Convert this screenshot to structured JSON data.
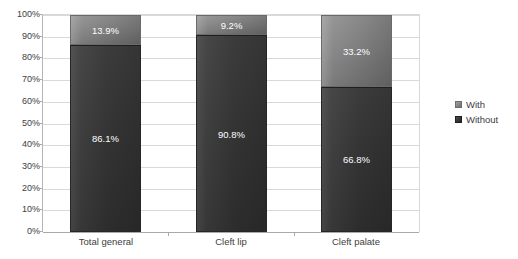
{
  "chart_data": {
    "type": "bar",
    "subtype": "100-percent-stacked-column",
    "title": "",
    "xlabel": "",
    "ylabel": "",
    "ylim": [
      0,
      100
    ],
    "grid": true,
    "legend_position": "right",
    "categories": [
      "Total general",
      "Cleft lip",
      "Cleft palate"
    ],
    "ytick_labels": [
      "100%",
      "90%",
      "80%",
      "70%",
      "60%",
      "50%",
      "40%",
      "30%",
      "20%",
      "10%",
      "0%"
    ],
    "ytick_values": [
      100,
      90,
      80,
      70,
      60,
      50,
      40,
      30,
      20,
      10,
      0
    ],
    "series": [
      {
        "name": "Without",
        "color": "#333333",
        "values": [
          86.1,
          90.8,
          66.8
        ],
        "labels": [
          "86.1%",
          "90.8%",
          "66.8%"
        ]
      },
      {
        "name": "With",
        "color": "#808080",
        "values": [
          13.9,
          9.2,
          33.2
        ],
        "labels": [
          "13.9%",
          "9.2%",
          "33.2%"
        ]
      }
    ],
    "stack_order_bottom_to_top": [
      "Without",
      "With"
    ]
  },
  "legend": {
    "items": [
      {
        "label": "With",
        "swatch": "with-swatch-icon"
      },
      {
        "label": "Without",
        "swatch": "without-swatch-icon"
      }
    ]
  },
  "caption": {
    "cut_off_text": ""
  }
}
